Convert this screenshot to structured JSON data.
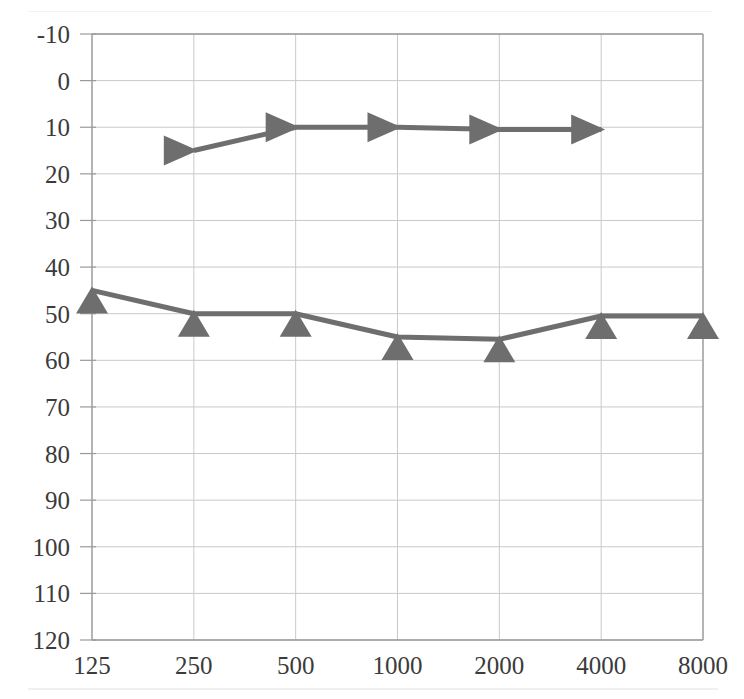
{
  "chart_data": {
    "type": "line",
    "title": "",
    "subtitle": "",
    "xlabel": "",
    "ylabel": "",
    "x": [
      125,
      250,
      500,
      1000,
      2000,
      4000,
      8000
    ],
    "categories": [
      "125",
      "250",
      "500",
      "1000",
      "2000",
      "4000",
      "8000"
    ],
    "xtick_labels": [
      "125",
      "250",
      "500",
      "1000",
      "2000",
      "4000",
      "8000"
    ],
    "ytick_labels": [
      "-10",
      "0",
      "10",
      "20",
      "30",
      "40",
      "50",
      "60",
      "70",
      "80",
      "90",
      "100",
      "110",
      "120"
    ],
    "ytick_values": [
      -10,
      0,
      10,
      20,
      30,
      40,
      50,
      60,
      70,
      80,
      90,
      100,
      110,
      120
    ],
    "ylim": [
      -10,
      120
    ],
    "y_inverted": true,
    "grid": true,
    "legend": "none",
    "series": [
      {
        "name": "bone-conduction-masked",
        "marker": "right-triangle",
        "color": "#6e6e6e",
        "x": [
          250,
          500,
          1000,
          2000,
          4000
        ],
        "values": [
          15,
          10,
          10,
          10.5,
          10.5
        ]
      },
      {
        "name": "air-conduction-masked",
        "marker": "up-triangle",
        "color": "#6e6e6e",
        "x": [
          125,
          250,
          500,
          1000,
          2000,
          4000,
          8000
        ],
        "values": [
          45,
          50,
          50,
          55,
          55.5,
          50.5,
          50.5
        ]
      }
    ],
    "annotations": []
  },
  "style": {
    "marker_color": "#6e6e6e",
    "line_color": "#6e6e6e",
    "grid_color": "#c9c9c9",
    "axis_color": "#9a9a9a",
    "text_color": "#3b3b3b",
    "background": "#ffffff"
  }
}
